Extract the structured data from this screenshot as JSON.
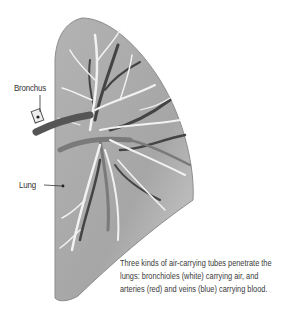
{
  "figure": {
    "labels": {
      "bronchus": "Bronchus",
      "lung": "Lung"
    },
    "caption": {
      "lines": [
        "Three kinds of air-carrying tubes penetrate the",
        "lungs: bronchioles (white) carrying air, and",
        "arteries (red) and veins (blue) carrying blood."
      ]
    },
    "colors": {
      "lung_fill": "#a9a9a9",
      "lung_edge": "#8c8c8c",
      "bronchioles": "#f2f2f2",
      "arteries": "#7a7a7a",
      "veins": "#3f3f3f",
      "text": "#333333"
    }
  }
}
